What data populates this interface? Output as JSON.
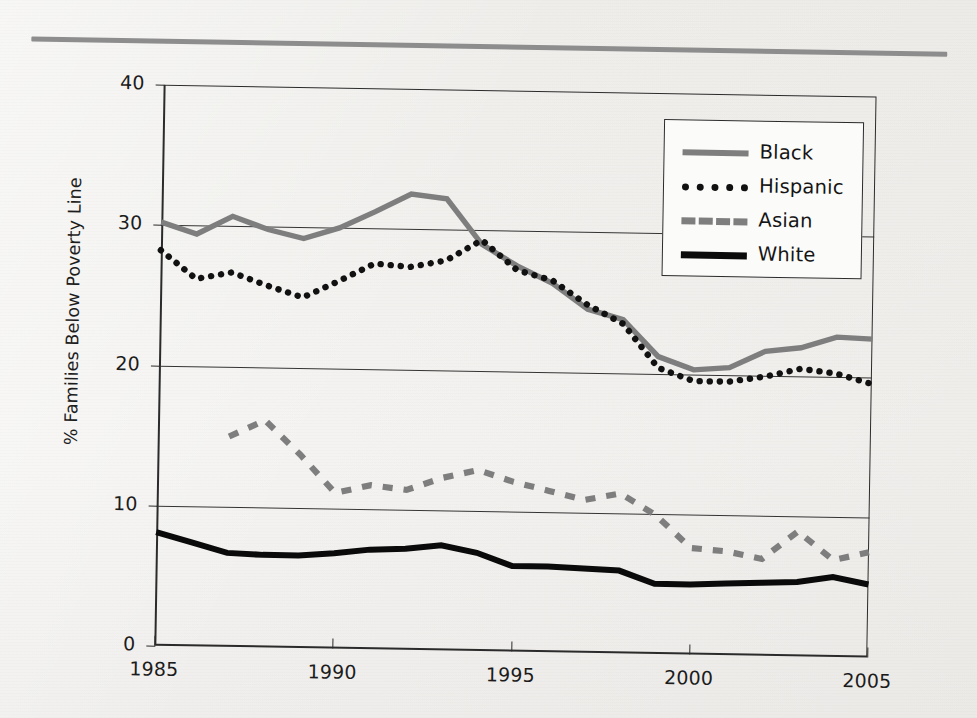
{
  "figure": {
    "background_color": "#f1f0ee",
    "rule_color": "#8d8d8d"
  },
  "axis": {
    "y_title": "% Families Below Poverty Line",
    "y_ticks": [
      "0",
      "10",
      "20",
      "30",
      "40"
    ],
    "x_ticks": [
      "1985",
      "1990",
      "1995",
      "2000",
      "2005"
    ]
  },
  "legend": {
    "entries": [
      {
        "label": "Black",
        "style": "solid",
        "color": "#7e7e7e",
        "swatch_icon": "line-swatch-solid-gray"
      },
      {
        "label": "Hispanic",
        "style": "dotted",
        "color": "#111111",
        "swatch_icon": "line-swatch-dotted-black"
      },
      {
        "label": "Asian",
        "style": "dashed",
        "color": "#7e7e7e",
        "swatch_icon": "line-swatch-dashed-gray"
      },
      {
        "label": "White",
        "style": "solid",
        "color": "#0a0a0a",
        "swatch_icon": "line-swatch-solid-black"
      }
    ]
  },
  "chart_data": {
    "type": "line",
    "title": "",
    "xlabel": "",
    "ylabel": "% Families Below Poverty Line",
    "xlim": [
      1985,
      2005
    ],
    "ylim": [
      0,
      40
    ],
    "x_tick_values": [
      1985,
      1990,
      1995,
      2000,
      2005
    ],
    "y_tick_values": [
      0,
      10,
      20,
      30,
      40
    ],
    "grid": "horizontal",
    "legend_position": "top-right-inside",
    "x": [
      1985,
      1986,
      1987,
      1988,
      1989,
      1990,
      1991,
      1992,
      1993,
      1994,
      1995,
      1996,
      1997,
      1998,
      1999,
      2000,
      2001,
      2002,
      2003,
      2004,
      2005
    ],
    "series": [
      {
        "name": "Black",
        "color": "#7e7e7e",
        "style": "solid",
        "values": [
          30.2,
          29.4,
          30.7,
          29.8,
          29.2,
          30.0,
          31.2,
          32.5,
          32.2,
          29.0,
          27.5,
          26.3,
          24.5,
          23.8,
          21.2,
          20.3,
          20.5,
          21.7,
          22.0,
          22.8,
          22.7
        ]
      },
      {
        "name": "Hispanic",
        "color": "#111111",
        "style": "dotted",
        "values": [
          28.2,
          26.2,
          26.7,
          25.8,
          25.0,
          26.2,
          27.5,
          27.3,
          27.8,
          29.3,
          27.2,
          26.5,
          24.8,
          23.5,
          20.4,
          19.5,
          19.5,
          19.9,
          20.5,
          20.2,
          19.5
        ]
      },
      {
        "name": "Asian",
        "color": "#7e7e7e",
        "style": "dashed",
        "values": [
          null,
          null,
          15.0,
          16.2,
          13.8,
          11.1,
          11.7,
          11.4,
          12.3,
          12.9,
          12.1,
          11.5,
          10.9,
          11.4,
          9.9,
          7.6,
          7.4,
          6.9,
          8.9,
          6.9,
          7.5
        ]
      },
      {
        "name": "White",
        "color": "#0a0a0a",
        "style": "solid",
        "values": [
          8.1,
          7.4,
          6.7,
          6.6,
          6.6,
          6.8,
          7.1,
          7.2,
          7.5,
          7.0,
          6.1,
          6.1,
          6.0,
          5.9,
          5.0,
          5.0,
          5.1,
          5.2,
          5.3,
          5.7,
          5.2
        ]
      }
    ]
  }
}
